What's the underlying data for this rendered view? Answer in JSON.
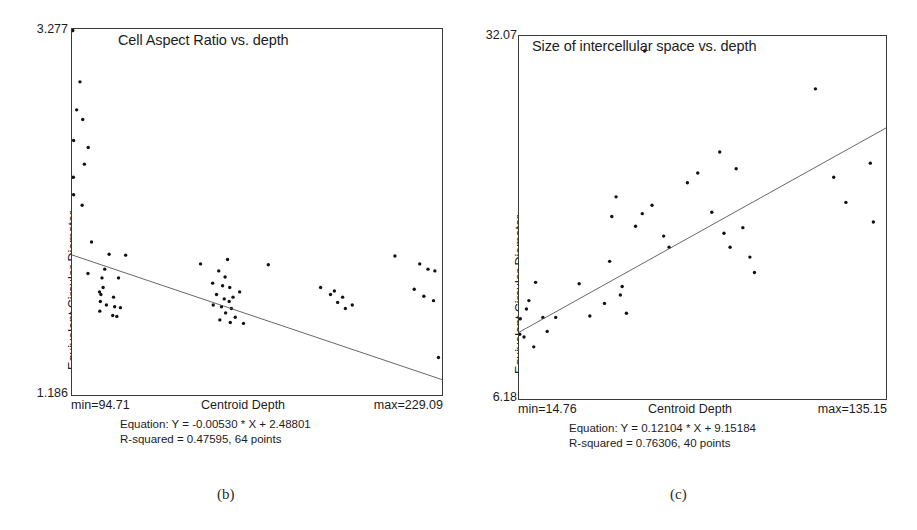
{
  "figure": {
    "background": "#ffffff",
    "ink_color": "#1c1c1c"
  },
  "panels": [
    {
      "id": "b",
      "caption": "(b)",
      "title": "Cell Aspect Ratio vs. depth",
      "y_axis_title": "Equivalent Circular Diameter",
      "y_max_label": "3.277",
      "y_min_label": "1.186",
      "x_min_label": "min=94.71",
      "x_title": "Centroid Depth",
      "x_max_label": "max=229.09",
      "equation_line": "Equation: Y = -0.00530 * X + 2.48801",
      "stats_line": "R-squared = 0.47595, 64 points"
    },
    {
      "id": "c",
      "caption": "(c)",
      "title": "Size of intercellular space vs. depth",
      "y_axis_title": "Equivalent Circular Diameter",
      "y_max_label": "32.07",
      "y_min_label": "6.18",
      "x_min_label": "min=14.76",
      "x_title": "Centroid Depth",
      "x_max_label": "max=135.15",
      "equation_line": "Equation: Y = 0.12104 * X + 9.15184",
      "stats_line": "R-squared = 0.76306, 40 points"
    }
  ],
  "chart_data": [
    {
      "type": "scatter",
      "panel": "b",
      "title": "Cell Aspect Ratio vs. depth",
      "xlabel": "Centroid Depth",
      "ylabel": "Equivalent Circular Diameter",
      "xlim": [
        94.71,
        229.09
      ],
      "ylim": [
        1.186,
        3.277
      ],
      "grid": false,
      "legend": "none",
      "n_points": 64,
      "r_squared": 0.47595,
      "fit_slope": -0.0053,
      "fit_intercept": 2.48801,
      "fit_equation": "Y = -0.00530 * X + 2.48801",
      "points": [
        [
          95.0,
          3.268
        ],
        [
          97.6,
          2.975
        ],
        [
          96.4,
          2.815
        ],
        [
          98.6,
          2.76
        ],
        [
          95.3,
          2.64
        ],
        [
          100.6,
          2.6
        ],
        [
          99.2,
          2.505
        ],
        [
          95.2,
          2.43
        ],
        [
          95.3,
          2.33
        ],
        [
          98.4,
          2.27
        ],
        [
          101.8,
          2.06
        ],
        [
          108.2,
          1.99
        ],
        [
          114.2,
          1.985
        ],
        [
          106.6,
          1.905
        ],
        [
          100.5,
          1.88
        ],
        [
          105.6,
          1.855
        ],
        [
          111.6,
          1.855
        ],
        [
          106.0,
          1.8
        ],
        [
          104.7,
          1.775
        ],
        [
          105.2,
          1.76
        ],
        [
          109.8,
          1.745
        ],
        [
          105.0,
          1.72
        ],
        [
          107.2,
          1.7
        ],
        [
          110.2,
          1.69
        ],
        [
          112.3,
          1.685
        ],
        [
          104.8,
          1.665
        ],
        [
          109.5,
          1.64
        ],
        [
          111.0,
          1.635
        ],
        [
          141.4,
          1.935
        ],
        [
          151.2,
          1.96
        ],
        [
          148.0,
          1.895
        ],
        [
          150.3,
          1.86
        ],
        [
          145.8,
          1.825
        ],
        [
          149.4,
          1.81
        ],
        [
          152.0,
          1.8
        ],
        [
          155.6,
          1.775
        ],
        [
          147.2,
          1.76
        ],
        [
          153.2,
          1.745
        ],
        [
          150.0,
          1.735
        ],
        [
          151.8,
          1.72
        ],
        [
          146.0,
          1.7
        ],
        [
          149.0,
          1.69
        ],
        [
          152.6,
          1.68
        ],
        [
          150.5,
          1.655
        ],
        [
          154.0,
          1.63
        ],
        [
          148.4,
          1.615
        ],
        [
          152.2,
          1.6
        ],
        [
          157.0,
          1.595
        ],
        [
          166.0,
          1.93
        ],
        [
          185.0,
          1.8
        ],
        [
          190.0,
          1.78
        ],
        [
          188.6,
          1.76
        ],
        [
          193.0,
          1.745
        ],
        [
          191.2,
          1.715
        ],
        [
          196.5,
          1.7
        ],
        [
          194.0,
          1.68
        ],
        [
          212.0,
          1.98
        ],
        [
          221.0,
          1.935
        ],
        [
          224.0,
          1.905
        ],
        [
          226.5,
          1.895
        ],
        [
          219.0,
          1.79
        ],
        [
          222.5,
          1.75
        ],
        [
          226.0,
          1.725
        ],
        [
          227.8,
          1.4
        ]
      ]
    },
    {
      "type": "scatter",
      "panel": "c",
      "title": "Size of intercellular space vs. depth",
      "xlabel": "Centroid Depth",
      "ylabel": "Equivalent Circular Diameter",
      "xlim": [
        14.76,
        135.15
      ],
      "ylim": [
        6.18,
        32.07
      ],
      "grid": false,
      "legend": "none",
      "n_points": 40,
      "r_squared": 0.76306,
      "fit_slope": 0.12104,
      "fit_intercept": 9.15184,
      "fit_equation": "Y = 0.12104 * X + 9.15184",
      "points": [
        [
          15.2,
          11.9
        ],
        [
          15.0,
          10.8
        ],
        [
          16.4,
          10.6
        ],
        [
          17.2,
          12.6
        ],
        [
          18.0,
          13.2
        ],
        [
          19.6,
          9.9
        ],
        [
          20.2,
          14.5
        ],
        [
          22.6,
          12.0
        ],
        [
          24.0,
          11.0
        ],
        [
          26.8,
          12.0
        ],
        [
          34.5,
          14.4
        ],
        [
          38.0,
          12.1
        ],
        [
          42.8,
          13.0
        ],
        [
          44.5,
          16.0
        ],
        [
          45.2,
          19.2
        ],
        [
          46.6,
          20.6
        ],
        [
          48.0,
          13.6
        ],
        [
          48.6,
          14.2
        ],
        [
          50.0,
          12.3
        ],
        [
          53.0,
          18.5
        ],
        [
          55.2,
          19.4
        ],
        [
          56.0,
          31.0
        ],
        [
          58.4,
          20.0
        ],
        [
          62.2,
          17.8
        ],
        [
          64.0,
          17.0
        ],
        [
          70.0,
          21.6
        ],
        [
          73.4,
          22.3
        ],
        [
          78.0,
          19.5
        ],
        [
          80.6,
          23.8
        ],
        [
          82.0,
          18.0
        ],
        [
          84.0,
          17.0
        ],
        [
          86.0,
          22.6
        ],
        [
          88.2,
          18.4
        ],
        [
          90.5,
          16.3
        ],
        [
          92.0,
          15.2
        ],
        [
          112.0,
          28.3
        ],
        [
          118.0,
          22.0
        ],
        [
          122.0,
          20.2
        ],
        [
          130.0,
          23.0
        ],
        [
          131.0,
          18.8
        ]
      ]
    }
  ]
}
